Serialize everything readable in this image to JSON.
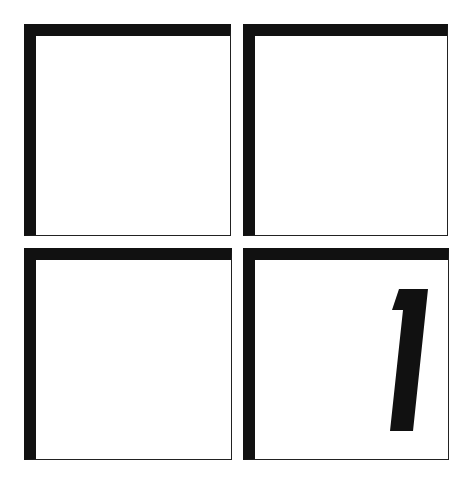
{
  "grid": {
    "rows": 2,
    "cols": 2,
    "border_color": "#111111",
    "background": "#ffffff",
    "tiles": [
      {
        "position": "top-left",
        "content": ""
      },
      {
        "position": "top-right",
        "content": ""
      },
      {
        "position": "bottom-left",
        "content": ""
      },
      {
        "position": "bottom-right",
        "content": "1"
      }
    ]
  }
}
